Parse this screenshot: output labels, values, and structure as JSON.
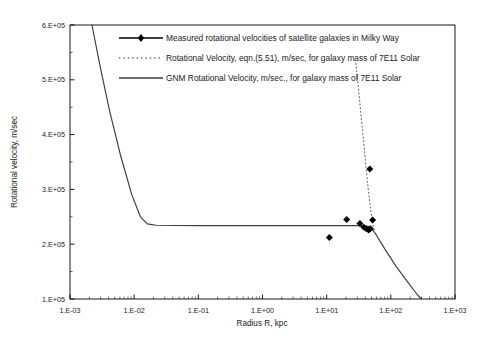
{
  "chart_data": {
    "type": "line",
    "title": "",
    "xlabel": "Radius R, kpc",
    "ylabel": "Rotational velocity, m/sec",
    "xscale": "log",
    "yscale": "linear",
    "xlim": [
      0.001,
      1000
    ],
    "ylim": [
      100000,
      600000
    ],
    "grid": false,
    "legend_position": "top-center-inside",
    "xticklabels": [
      "1.E-03",
      "1.E-02",
      "1.E-01",
      "1.E+00",
      "1.E+01",
      "1.E+02",
      "1.E+03"
    ],
    "xtickvalues": [
      0.001,
      0.01,
      0.1,
      1,
      10,
      100,
      1000
    ],
    "yticklabels": [
      "1.E+05",
      "2.E+05",
      "3.E+05",
      "4.E+05",
      "5.E+05",
      "6.E+05"
    ],
    "ytickvalues": [
      100000,
      200000,
      300000,
      400000,
      500000,
      600000
    ],
    "series": [
      {
        "name": "Measured rotational velocities of satellite galaxies in Milky Way",
        "type": "scatter",
        "marker": "diamond",
        "color": "#000000",
        "points": [
          {
            "x": 11.0,
            "y": 212000
          },
          {
            "x": 20.5,
            "y": 245000
          },
          {
            "x": 33.0,
            "y": 238000
          },
          {
            "x": 38.0,
            "y": 231000
          },
          {
            "x": 41.5,
            "y": 228000
          },
          {
            "x": 45.0,
            "y": 226000
          },
          {
            "x": 48.0,
            "y": 228000
          },
          {
            "x": 52.0,
            "y": 244000
          },
          {
            "x": 47.0,
            "y": 337000
          }
        ]
      },
      {
        "name": "Rotational Velocity, eqn.(5.51), m/sec, for galaxy mass of 7E11 Solar",
        "type": "line",
        "style": "dotted",
        "color": "#6b6b6b",
        "points": [
          {
            "x": 28.5,
            "y": 530000
          },
          {
            "x": 31.0,
            "y": 490000
          },
          {
            "x": 34.0,
            "y": 440000
          },
          {
            "x": 37.5,
            "y": 390000
          },
          {
            "x": 41.0,
            "y": 340000
          },
          {
            "x": 45.0,
            "y": 295000
          },
          {
            "x": 49.0,
            "y": 258000
          },
          {
            "x": 53.0,
            "y": 234000
          },
          {
            "x": 56.0,
            "y": 222000
          }
        ]
      },
      {
        "name": "GNM Rotational Velocity, m/sec., for galaxy mass of 7E11 Solar",
        "type": "line",
        "style": "solid",
        "color": "#3c3c3c",
        "points": [
          {
            "x": 0.0022,
            "y": 600000
          },
          {
            "x": 0.003,
            "y": 520000
          },
          {
            "x": 0.0042,
            "y": 440000
          },
          {
            "x": 0.0062,
            "y": 360000
          },
          {
            "x": 0.0092,
            "y": 290000
          },
          {
            "x": 0.0125,
            "y": 250000
          },
          {
            "x": 0.016,
            "y": 237000
          },
          {
            "x": 0.022,
            "y": 234500
          },
          {
            "x": 0.1,
            "y": 234000
          },
          {
            "x": 1.0,
            "y": 234000
          },
          {
            "x": 10.0,
            "y": 234000
          },
          {
            "x": 30.0,
            "y": 234000
          },
          {
            "x": 48.0,
            "y": 232000
          },
          {
            "x": 60.0,
            "y": 216000
          },
          {
            "x": 80.0,
            "y": 192000
          },
          {
            "x": 120.0,
            "y": 160000
          },
          {
            "x": 180.0,
            "y": 132000
          },
          {
            "x": 250.0,
            "y": 110000
          },
          {
            "x": 300.0,
            "y": 100000
          }
        ]
      }
    ]
  },
  "legend": {
    "entries": [
      {
        "label": "Measured rotational velocities of satellite galaxies in Milky Way",
        "marker": "line-with-diamond"
      },
      {
        "label": "Rotational Velocity, eqn.(5.51), m/sec, for galaxy mass of 7E11 Solar",
        "marker": "dotted-line"
      },
      {
        "label": "GNM Rotational Velocity, m/sec., for galaxy mass of 7E11 Solar",
        "marker": "solid-line"
      }
    ]
  },
  "colors": {
    "axis": "#000000",
    "gnm_curve": "#3c3c3c",
    "eqn_curve": "#6b6b6b",
    "marker": "#000000",
    "background": "#ffffff"
  }
}
